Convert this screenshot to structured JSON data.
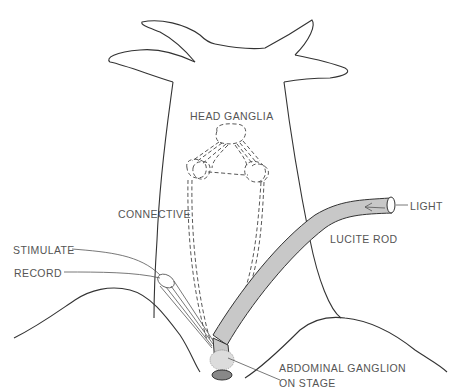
{
  "diagram": {
    "labels": {
      "head_ganglia": "HEAD GANGLIA",
      "connective": "CONNECTIVE",
      "stimulate": "STIMULATE",
      "record": "RECORD",
      "lucite_rod": "LUCITE ROD",
      "light": "LIGHT",
      "abdominal_ganglion_line1": "ABDOMINAL GANGLION",
      "abdominal_ganglion_line2": "ON STAGE"
    },
    "colors": {
      "line": "#333333",
      "text": "#555555",
      "rod_fill": "#c8c8c8",
      "background": "#ffffff"
    }
  }
}
